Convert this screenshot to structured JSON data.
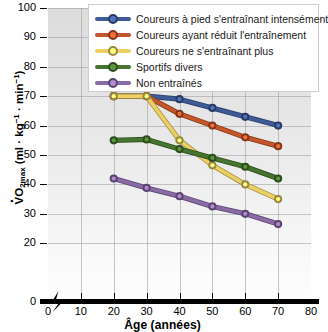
{
  "chart_data": {
    "type": "line",
    "title": "",
    "xlabel": "Âge (années)",
    "ylabel": "V̇O2max (ml · kg-1 · min-1)",
    "x": [
      20,
      30,
      40,
      50,
      60,
      70
    ],
    "xlim": [
      0,
      80
    ],
    "ylim": [
      0,
      100
    ],
    "xticks": [
      "0",
      "10",
      "20",
      "30",
      "40",
      "50",
      "60",
      "70",
      "80"
    ],
    "xtick_values": [
      0,
      10,
      20,
      30,
      40,
      50,
      60,
      70,
      80
    ],
    "yticks": [
      "0",
      "20",
      "30",
      "40",
      "50",
      "60",
      "70",
      "80",
      "90",
      "100"
    ],
    "ytick_values": [
      0,
      20,
      30,
      40,
      50,
      60,
      70,
      80,
      90,
      100
    ],
    "grid": true,
    "legend_position": "top-right",
    "x_axis_break": true,
    "series": [
      {
        "name": "Coureurs à pied s'entraînant intensément",
        "color": "#3f5b97",
        "values": [
          70,
          70,
          69,
          66,
          63,
          60
        ]
      },
      {
        "name": "Coureurs ayant réduit l'entraînement",
        "color": "#c3562a",
        "values": [
          70,
          70,
          64,
          60,
          56,
          53
        ]
      },
      {
        "name": "Coureurs ne s'entraînant plus",
        "color": "#ecd064",
        "values": [
          70,
          70,
          55,
          46.5,
          40,
          35
        ]
      },
      {
        "name": "Sportifs divers",
        "color": "#46752f",
        "values": [
          55,
          55.3,
          52,
          49,
          46,
          42
        ]
      },
      {
        "name": "Non entraînés",
        "color": "#8a6ba6",
        "values": [
          42,
          38.8,
          36,
          32.5,
          30,
          26.5
        ]
      }
    ]
  },
  "axis": {
    "y_title_main": "VO",
    "y_title_sub": "2max",
    "y_title_units_open": " (ml",
    "y_title_kg": "kg",
    "y_title_min": "min",
    "y_title_exp": "-1",
    "y_title_close": ")",
    "x_title": "Âge (années)"
  }
}
